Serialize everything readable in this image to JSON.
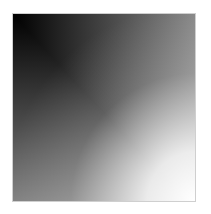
{
  "image": {
    "description": "Grayscale 2D gradient square",
    "corners": {
      "top_left": "#000000",
      "top_right": "#888888",
      "bottom_left": "#7f7f7f",
      "bottom_right": "#ffffff"
    },
    "border_color": "#cfcfcf",
    "background": "#ffffff"
  }
}
